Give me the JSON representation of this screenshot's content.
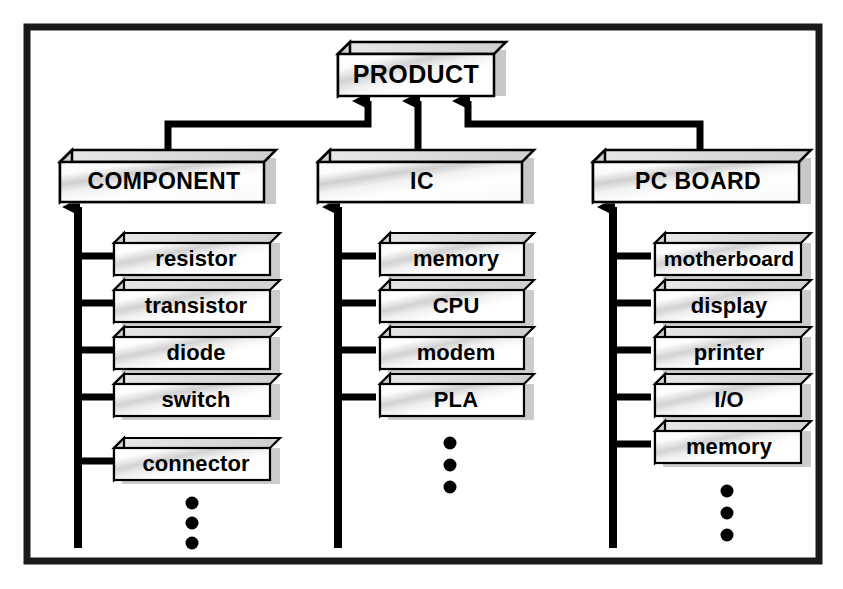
{
  "diagram": {
    "frame": {
      "stroke_color": "#1a1a1a"
    },
    "colors": {
      "box_face_light": "#ffffff",
      "box_face_shade": "#c9c9c9",
      "box_side": "#b3b3b3",
      "box_top": "#e0e0e0",
      "box_outline": "#000000",
      "shadow": "#9a9a9a",
      "connector": "#000000",
      "background": "#ffffff"
    },
    "root": {
      "label": "PRODUCT"
    },
    "branches": [
      {
        "label": "COMPONENT",
        "leaves": [
          {
            "label": "resistor"
          },
          {
            "label": "transistor"
          },
          {
            "label": "diode"
          },
          {
            "label": "switch"
          },
          {
            "label": "connector"
          }
        ],
        "ellipsis": "⋮",
        "ellipsis_dots": 3
      },
      {
        "label": "IC",
        "leaves": [
          {
            "label": "memory"
          },
          {
            "label": "CPU"
          },
          {
            "label": "modem"
          },
          {
            "label": "PLA"
          }
        ],
        "ellipsis": "⋮",
        "ellipsis_dots": 3
      },
      {
        "label": "PC BOARD",
        "leaves": [
          {
            "label": "motherboard"
          },
          {
            "label": "display"
          },
          {
            "label": "printer"
          },
          {
            "label": "I/O"
          },
          {
            "label": "memory"
          }
        ],
        "ellipsis": "⋮",
        "ellipsis_dots": 3
      }
    ]
  }
}
